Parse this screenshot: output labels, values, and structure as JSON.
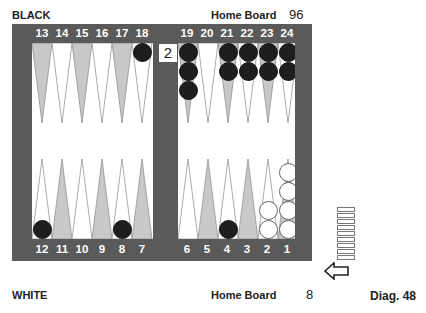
{
  "labels": {
    "top_player": "BLACK",
    "bottom_player": "WHITE",
    "top_home": "Home Board",
    "bottom_home": "Home Board",
    "top_pip": "96",
    "bottom_pip": "8",
    "diagram": "Diag. 48"
  },
  "colors": {
    "frame": "#5a5a5a",
    "point_dark": "#c8c8c8",
    "point_light": "#ffffff",
    "black_checker": "#1e1e1e",
    "white_checker": "#ffffff"
  },
  "cube": {
    "value": "2",
    "location": "bar"
  },
  "on_roll": "white",
  "borne_off": {
    "white": 9,
    "black": 0
  },
  "top_numbers_left": [
    "13",
    "14",
    "15",
    "16",
    "17",
    "18"
  ],
  "top_numbers_right": [
    "19",
    "20",
    "21",
    "22",
    "23",
    "24"
  ],
  "bottom_numbers_left": [
    "12",
    "11",
    "10",
    "9",
    "8",
    "7"
  ],
  "bottom_numbers_right": [
    "6",
    "5",
    "4",
    "3",
    "2",
    "1"
  ],
  "position": {
    "black": {
      "18": 1,
      "19": 3,
      "21": 2,
      "22": 2,
      "23": 2,
      "24": 2,
      "12": 1,
      "8": 1,
      "4": 1
    },
    "white": {
      "2": 2,
      "1": 4
    }
  }
}
